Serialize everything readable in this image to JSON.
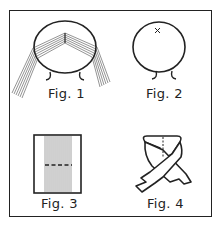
{
  "figures": [
    {
      "id": "fig1",
      "caption": "Fig. 1",
      "subject": "round basket frame with bundles of strands draped over the rim in a V shape"
    },
    {
      "id": "fig2",
      "caption": "Fig. 2",
      "subject": "round basket frame with feet, starting point marked with x"
    },
    {
      "id": "fig3",
      "caption": "Fig. 3",
      "subject": "rectangle with vertical strands and dashed fold line"
    },
    {
      "id": "fig4",
      "caption": "Fig. 4",
      "subject": "folded ribbon crossing with dotted centre line"
    }
  ],
  "colors": {
    "ink": "#222222",
    "strand": "#777777",
    "background": "#ffffff"
  }
}
